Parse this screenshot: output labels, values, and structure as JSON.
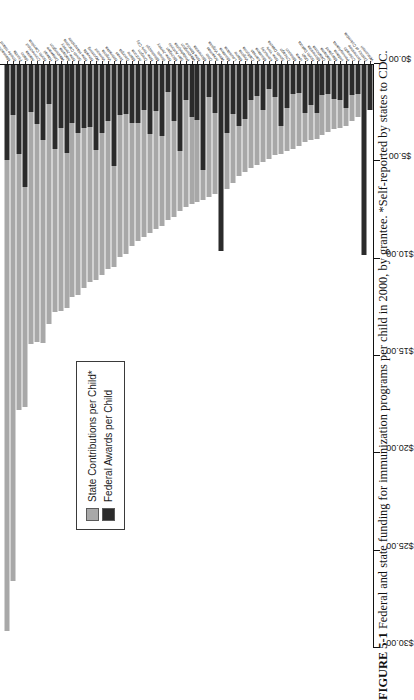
{
  "figure": {
    "number": "FIGURE 5-1",
    "caption": "Federal and state funding for immunization programs per child in 2000, by grantee. *Self-reported by states to CDC."
  },
  "legend": {
    "position": "inside-left",
    "items": [
      {
        "label": "State Contributions per Child*",
        "color": "#a8a8a8",
        "name": "state-contributions"
      },
      {
        "label": "Federal Awards per Child",
        "color": "#2b2b2b",
        "name": "federal-awards"
      }
    ]
  },
  "chart_data": {
    "type": "bar",
    "orientation": "horizontal-stacked",
    "title": "",
    "xlabel": "",
    "ylabel": "",
    "xlim": [
      0,
      30
    ],
    "grid": false,
    "tick_labels": [
      "$30.00",
      "$25.00",
      "$20.00",
      "$15.00",
      "$10.00",
      "$5.00",
      "$0.00"
    ],
    "tick_values": [
      30,
      25,
      20,
      15,
      10,
      5,
      0
    ],
    "axis_direction": "descending-left-to-right",
    "series": [
      {
        "name": "Federal Awards per Child",
        "color": "#2b2b2b"
      },
      {
        "name": "State Contributions per Child*",
        "color": "#a8a8a8"
      }
    ],
    "categories": [
      "Massachusetts",
      "Rhode Island",
      "Florida",
      "Idaho",
      "Alaska",
      "Connecticut",
      "North Carolina",
      "Hawaii",
      "Delaware",
      "Washington",
      "Alabama",
      "New Jersey",
      "South Carolina",
      "New Hampshire",
      "Nevada",
      "Wyoming",
      "Vermont",
      "Virginia",
      "Nebraska",
      "Texas",
      "Georgia",
      "Maine",
      "Arizona",
      "Oregon",
      "New York City",
      "Mississippi",
      "Illinois",
      "New Jersey",
      "Michigan",
      "San Antonio",
      "Philadelphia",
      "Washington",
      "New Mexico",
      "Minnesota",
      "Ohio",
      "Arkansas",
      "West Virginia",
      "Montana",
      "Louisiana",
      "Maine",
      "Virginia",
      "California",
      "Kansas",
      "Montana",
      "Kentucky",
      "New York",
      "South Dakota",
      "Chicago",
      "Missouri",
      "Iowa",
      "Utah",
      "North Dakota",
      "Minnesota",
      "Oklahoma",
      "Alabama",
      "Maryland",
      "Indiana",
      "Pennsylvania",
      "Colorado",
      "Tennessee",
      "District of Columbia",
      "Wisconsin"
    ],
    "federal_values": [
      4.95,
      2.6,
      4.6,
      6.3,
      2.45,
      3.1,
      3.9,
      2.05,
      4.35,
      3.3,
      4.55,
      3.05,
      3.55,
      3.3,
      3.25,
      4.4,
      3.55,
      2.95,
      5.25,
      2.6,
      2.55,
      3.05,
      3.05,
      2.35,
      3.6,
      2.4,
      3.7,
      1.45,
      2.95,
      4.45,
      1.85,
      2.7,
      2.9,
      5.45,
      1.7,
      2.5,
      9.6,
      3.55,
      2.55,
      3.2,
      2.85,
      1.85,
      1.65,
      2.35,
      1.3,
      1.7,
      3.2,
      2.25,
      1.55,
      1.5,
      2.5,
      2.1,
      2.5,
      1.6,
      1.55,
      1.8,
      1.85,
      2.25,
      1.6,
      1.55,
      9.8,
      2.35
    ],
    "state_values": [
      24.2,
      23.95,
      13.2,
      11.3,
      11.95,
      11.2,
      10.45,
      11.3,
      8.4,
      9.4,
      8.0,
      8.9,
      8.3,
      8.2,
      7.95,
      6.7,
      7.3,
      7.6,
      5.2,
      7.3,
      7.2,
      6.3,
      6.05,
      6.55,
      5.1,
      6.1,
      4.6,
      6.55,
      4.9,
      3.1,
      5.5,
      4.5,
      4.2,
      1.55,
      5.15,
      4.2,
      0.0,
      2.85,
      3.55,
      2.55,
      2.7,
      3.5,
      3.55,
      2.7,
      3.6,
      3.0,
      1.45,
      2.2,
      2.8,
      2.7,
      1.5,
      1.8,
      1.35,
      2.05,
      1.95,
      1.55,
      1.45,
      0.95,
      1.35,
      1.15,
      0.0,
      0.0
    ]
  }
}
